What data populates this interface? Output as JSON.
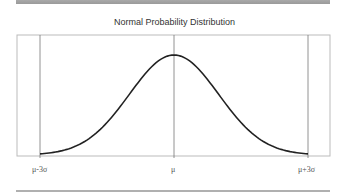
{
  "chart_data": {
    "type": "line",
    "title": "Normal Probability Distribution",
    "xlabel": "",
    "ylabel": "",
    "tick_labels": [
      "μ-3σ",
      "μ",
      "μ+3σ"
    ],
    "x": [
      -3,
      -2.5,
      -2,
      -1.5,
      -1,
      -0.5,
      0,
      0.5,
      1,
      1.5,
      2,
      2.5,
      3
    ],
    "values": [
      0.004,
      0.018,
      0.054,
      0.13,
      0.242,
      0.352,
      0.399,
      0.352,
      0.242,
      0.13,
      0.054,
      0.018,
      0.004
    ],
    "vertical_reference_lines": [
      "μ-3σ",
      "μ",
      "μ+3σ"
    ],
    "grid": false,
    "legend": "none"
  },
  "colors": {
    "curve": "#222222",
    "frame": "#bbbbbb",
    "reference_line": "#777777",
    "bar": "#a0a0a0"
  }
}
